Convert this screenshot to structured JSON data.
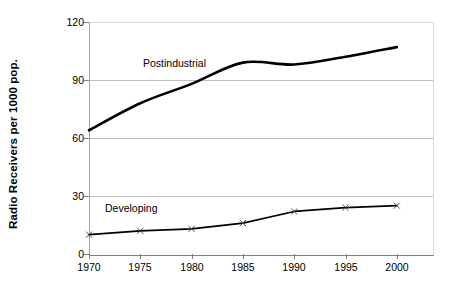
{
  "chart_data": {
    "type": "line",
    "title": "",
    "xlabel": "",
    "ylabel": "Radio Receivers per 1000 pop.",
    "x": [
      1970,
      1975,
      1980,
      1985,
      1990,
      1995,
      2000
    ],
    "categories": [
      "1970",
      "1975",
      "1980",
      "1985",
      "1990",
      "1995",
      "2000"
    ],
    "xlim": [
      1970,
      2003
    ],
    "ylim": [
      0,
      120
    ],
    "yticks": [
      0,
      30,
      60,
      90,
      120
    ],
    "ytick_labels": [
      "0",
      "30",
      "60",
      "90",
      "120"
    ],
    "xtick_labels": [
      "1970",
      "1975",
      "1980",
      "1985",
      "1990",
      "1995",
      "2000"
    ],
    "grid": "horizontal",
    "legend": "none",
    "markers": "x",
    "series": [
      {
        "name": "Postindustrial",
        "label_position": "above-line",
        "values": [
          64,
          78,
          88,
          99,
          98,
          102,
          107
        ],
        "color": "#000000",
        "line_width": 2.6
      },
      {
        "name": "Developing",
        "label_position": "above-line",
        "values": [
          10,
          12,
          13,
          16,
          22,
          24,
          25
        ],
        "color": "#000000",
        "line_width": 1.6
      }
    ],
    "annotations": [
      {
        "text": "Postindustrial",
        "series": "Postindustrial"
      },
      {
        "text": "Developing",
        "series": "Developing"
      }
    ]
  },
  "colors": {
    "plot_background": "#ffffff",
    "gridline": "#bfbfbf",
    "axis": "#7f7f7f",
    "series_line": "#000000",
    "text": "#000000"
  }
}
